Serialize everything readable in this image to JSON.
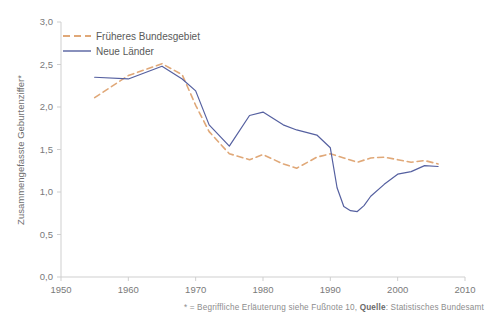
{
  "chart_data": {
    "type": "line",
    "title": "",
    "xlabel": "",
    "ylabel": "Zusammengefasste Geburtenziffer*",
    "xlim": [
      1950,
      2010
    ],
    "ylim": [
      0.0,
      3.0
    ],
    "grid": false,
    "legend_position": "top-left",
    "x_ticks": [
      "1950",
      "1960",
      "1970",
      "1980",
      "1990",
      "2000",
      "2010"
    ],
    "x_tick_values": [
      1950,
      1960,
      1970,
      1980,
      1990,
      2000,
      2010
    ],
    "y_ticks": [
      "0,0",
      "0,5",
      "1,0",
      "1,5",
      "2,0",
      "2,5",
      "3,0"
    ],
    "y_tick_values": [
      0.0,
      0.5,
      1.0,
      1.5,
      2.0,
      2.5,
      3.0
    ],
    "series": [
      {
        "name": "Früheres Bundesgebiet",
        "color": "#e0a878",
        "style": "dashed",
        "x": [
          1955,
          1960,
          1965,
          1968,
          1970,
          1972,
          1975,
          1978,
          1980,
          1983,
          1985,
          1988,
          1990,
          1992,
          1994,
          1996,
          1998,
          2000,
          2002,
          2004,
          2006
        ],
        "values": [
          2.11,
          2.37,
          2.51,
          2.38,
          2.02,
          1.71,
          1.45,
          1.38,
          1.44,
          1.33,
          1.28,
          1.41,
          1.45,
          1.4,
          1.35,
          1.4,
          1.41,
          1.38,
          1.35,
          1.37,
          1.33
        ]
      },
      {
        "name": "Neue Länder",
        "color": "#5560a0",
        "style": "solid",
        "x": [
          1955,
          1960,
          1965,
          1968,
          1970,
          1972,
          1975,
          1978,
          1980,
          1983,
          1985,
          1988,
          1990,
          1991,
          1992,
          1993,
          1994,
          1995,
          1996,
          1998,
          2000,
          2002,
          2004,
          2006
        ],
        "values": [
          2.35,
          2.33,
          2.48,
          2.33,
          2.19,
          1.79,
          1.54,
          1.9,
          1.94,
          1.79,
          1.73,
          1.67,
          1.52,
          1.05,
          0.83,
          0.78,
          0.77,
          0.84,
          0.95,
          1.09,
          1.21,
          1.24,
          1.31,
          1.3
        ]
      }
    ],
    "footnote": {
      "prefix": "* = Begriffliche Erläuterung siehe Fußnote 10, ",
      "source_label": "Quelle",
      "source_value": ": Statistisches Bundesamt"
    }
  }
}
